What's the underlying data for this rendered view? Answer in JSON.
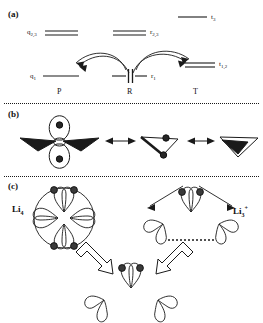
{
  "figure": {
    "panels": [
      {
        "id": "a",
        "label": "(a)"
      },
      {
        "id": "b",
        "label": "(b)"
      },
      {
        "id": "c",
        "label": "(c)"
      }
    ]
  },
  "panel_a": {
    "energy_levels": [
      {
        "name": "q23",
        "label": "q",
        "sub": "2,3",
        "lines": 2,
        "region": "P"
      },
      {
        "name": "q1",
        "label": "q",
        "sub": "1",
        "lines": 1,
        "region": "P"
      },
      {
        "name": "r23",
        "label": "r",
        "sub": "2,3",
        "lines": 2,
        "region": "R"
      },
      {
        "name": "r1",
        "label": "r",
        "sub": "1",
        "lines": 1,
        "region": "R"
      },
      {
        "name": "t3",
        "label": "t",
        "sub": "3",
        "lines": 1,
        "region": "T"
      },
      {
        "name": "t12",
        "label": "t",
        "sub": "1,2",
        "lines": 2,
        "region": "T"
      }
    ],
    "region_labels": [
      "P",
      "R",
      "T"
    ],
    "transfer_arrows": [
      {
        "name": "arrow-r-to-p",
        "from": "R",
        "to": "P"
      },
      {
        "name": "arrow-r-to-t",
        "from": "R",
        "to": "T"
      }
    ]
  },
  "panel_b": {
    "structures": [
      {
        "name": "structure-orbital-vertical",
        "dots": 2
      },
      {
        "name": "structure-v-shape-two-dots",
        "dots": 2
      },
      {
        "name": "structure-v-shape-filled",
        "dots": 0
      }
    ],
    "resonance_arrows": 2
  },
  "panel_c": {
    "species": [
      {
        "name": "li4",
        "label": "Li",
        "sub": "4",
        "sup": ""
      },
      {
        "name": "li3plus",
        "label": "Li",
        "sub": "3",
        "sup": "+"
      }
    ],
    "block_arrows": [
      {
        "name": "arrow-li4-to-center"
      },
      {
        "name": "arrow-center-to-li3plus"
      }
    ]
  },
  "colors": {
    "ink": "#111111",
    "dot_fill": "#3a3a3a",
    "line": "#1a1a1a"
  }
}
